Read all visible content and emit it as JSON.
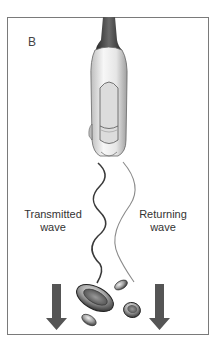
{
  "panel_label": "B",
  "labels": {
    "transmitted": [
      "Transmitted",
      "wave"
    ],
    "returning": [
      "Returning",
      "wave"
    ]
  },
  "colors": {
    "frame": "#7a7a7a",
    "arrow": "#555555",
    "wave_transmitted": "#3a3a3a",
    "wave_returning": "#8a8a8a",
    "probe_body": "#e8e8e8",
    "probe_cable": "#3c3c3c",
    "cell_dark": "#4a4a4a"
  },
  "elements": {
    "probe": "ultrasound transducer",
    "arrows": [
      "flow-direction-left",
      "flow-direction-right"
    ],
    "cells": [
      "large red blood cell",
      "small cell top",
      "small cell bottom-left",
      "round cell right"
    ]
  }
}
